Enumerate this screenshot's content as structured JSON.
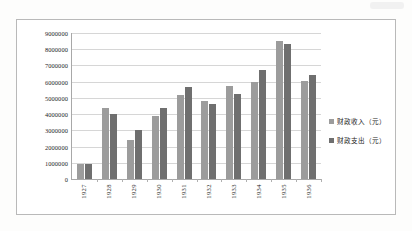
{
  "chart_data": {
    "type": "bar",
    "title": "",
    "xlabel": "",
    "ylabel": "",
    "ylim": [
      0,
      9000000
    ],
    "ytick_labels": [
      "9000000",
      "8000000",
      "7000000",
      "6000000",
      "5000000",
      "4000000",
      "3000000",
      "2000000",
      "1000000",
      "0"
    ],
    "ytick_values": [
      9000000,
      8000000,
      7000000,
      6000000,
      5000000,
      4000000,
      3000000,
      2000000,
      1000000,
      0
    ],
    "grid": true,
    "legend_position": "right",
    "categories": [
      "1927",
      "1928",
      "1929",
      "1930",
      "1931",
      "1932",
      "1933",
      "1934",
      "1935",
      "1936"
    ],
    "series": [
      {
        "name": "财政收入（元）",
        "color": "#9c9c9c",
        "values": [
          950000,
          4350000,
          2400000,
          3900000,
          5150000,
          4800000,
          5750000,
          5950000,
          8500000,
          6050000
        ]
      },
      {
        "name": "财政支出（元）",
        "color": "#6f6f6f",
        "values": [
          950000,
          4000000,
          3050000,
          4400000,
          5700000,
          4650000,
          5250000,
          6700000,
          8350000,
          6400000
        ]
      }
    ]
  },
  "legend": {
    "items": [
      {
        "label": "财政收入（元）",
        "swatch": "income"
      },
      {
        "label": "财政支出（元）",
        "swatch": "expenditure"
      }
    ]
  }
}
